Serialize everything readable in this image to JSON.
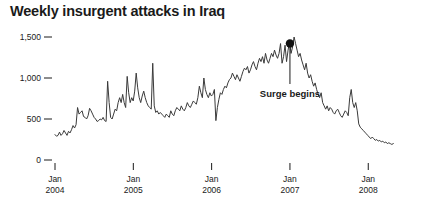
{
  "chart_data": {
    "type": "line",
    "title": "Weekly insurgent attacks in Iraq",
    "xlabel": "",
    "ylabel": "",
    "ylim": [
      0,
      1600
    ],
    "grid": false,
    "legend": null,
    "y_ticks": [
      {
        "value": 1500,
        "label": "1,500"
      },
      {
        "value": 1000,
        "label": "1,000"
      },
      {
        "value": 500,
        "label": "500"
      },
      {
        "value": 0,
        "label": "0"
      }
    ],
    "x_ticks": [
      {
        "value": 2004.0,
        "label_line1": "Jan",
        "label_line2": "2004"
      },
      {
        "value": 2005.0,
        "label_line1": "Jan",
        "label_line2": "2005"
      },
      {
        "value": 2006.0,
        "label_line1": "Jan",
        "label_line2": "2006"
      },
      {
        "value": 2007.0,
        "label_line1": "Jan",
        "label_line2": "2007"
      },
      {
        "value": 2008.0,
        "label_line1": "Jan",
        "label_line2": "2008"
      }
    ],
    "xlim": [
      2004.0,
      2008.75
    ],
    "annotations": [
      {
        "text": "Surge begins",
        "x": 2007.0,
        "y": 1420,
        "marker": "dot",
        "leader": "vertical"
      }
    ],
    "series": [
      {
        "name": "Weekly insurgent attacks",
        "color": "#3a3a3a",
        "x_start": 2004.0,
        "x_step": 0.0192,
        "values": [
          310,
          290,
          300,
          340,
          300,
          320,
          360,
          330,
          300,
          350,
          330,
          370,
          420,
          390,
          430,
          640,
          560,
          580,
          600,
          530,
          520,
          500,
          540,
          630,
          600,
          560,
          520,
          500,
          470,
          480,
          500,
          490,
          520,
          480,
          470,
          960,
          700,
          520,
          500,
          560,
          620,
          600,
          700,
          760,
          700,
          800,
          700,
          640,
          1020,
          820,
          700,
          760,
          720,
          840,
          1060,
          880,
          760,
          700,
          780,
          840,
          760,
          700,
          660,
          640,
          620,
          1180,
          660,
          580,
          600,
          560,
          580,
          560,
          540,
          520,
          560,
          540,
          520,
          600,
          560,
          540,
          600,
          640,
          620,
          600,
          660,
          620,
          600,
          640,
          700,
          660,
          640,
          680,
          720,
          700,
          680,
          760,
          900,
          820,
          760,
          1000,
          860,
          800,
          760,
          820,
          780,
          800,
          860,
          480,
          640,
          740,
          820,
          800,
          860,
          900,
          880,
          940,
          980,
          1000,
          1060,
          1020,
          980,
          1040,
          1000,
          960,
          1020,
          1080,
          1120,
          1100,
          1140,
          1060,
          1100,
          1160,
          1200,
          1140,
          1100,
          1180,
          1240,
          1200,
          1260,
          1180,
          1300,
          1220,
          1180,
          1240,
          1300,
          1260,
          1340,
          1280,
          1240,
          1300,
          1420,
          1180,
          1260,
          1400,
          1200,
          1340,
          1440,
          1300,
          1380,
          1500,
          1420,
          1340,
          1260,
          1300,
          1220,
          1160,
          1100,
          1180,
          1060,
          1000,
          1040,
          960,
          900,
          940,
          860,
          800,
          760,
          820,
          700,
          660,
          620,
          660,
          600,
          640,
          620,
          580,
          560,
          600,
          620,
          580,
          540,
          520,
          560,
          600,
          580,
          540,
          760,
          860,
          700,
          640,
          700,
          600,
          440,
          400,
          380,
          360,
          340,
          320,
          300,
          280,
          260,
          280,
          260,
          240,
          250,
          230,
          240,
          220,
          230,
          210,
          220,
          200,
          210,
          200,
          190,
          200
        ]
      }
    ]
  }
}
